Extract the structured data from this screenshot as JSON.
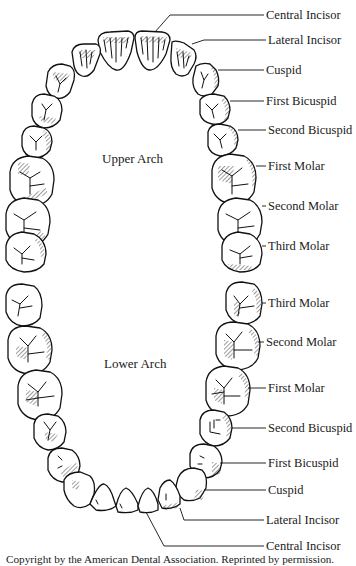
{
  "upper_arch": {
    "title": "Upper Arch",
    "labels": [
      {
        "text": "Central Incisor"
      },
      {
        "text": "Lateral Incisor"
      },
      {
        "text": "Cuspid"
      },
      {
        "text": "First Bicuspid"
      },
      {
        "text": "Second Bicuspid"
      },
      {
        "text": "First Molar"
      },
      {
        "text": "Second Molar"
      },
      {
        "text": "Third Molar"
      }
    ]
  },
  "lower_arch": {
    "title": "Lower Arch",
    "labels": [
      {
        "text": "Third Molar"
      },
      {
        "text": "Second Molar"
      },
      {
        "text": "First Molar"
      },
      {
        "text": "Second Bicuspid"
      },
      {
        "text": "First Bicuspid"
      },
      {
        "text": "Cuspid"
      },
      {
        "text": "Lateral Incisor"
      },
      {
        "text": "Central Incisor"
      }
    ]
  },
  "credit": "Copyright by the American Dental Association. Reprinted by permission."
}
